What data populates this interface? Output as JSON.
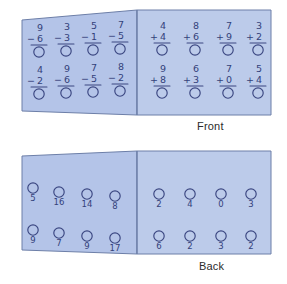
{
  "figure": {
    "title_front": "Front",
    "title_back": "Back",
    "colors": {
      "card_fill": "#b4c4e8",
      "card_fill_right": "#bccbea",
      "card_edge": "#6d7fa8",
      "ink": "#33417a",
      "caption_text": "#2b2b2b",
      "page_background": "#ffffff"
    }
  },
  "front_panel": {
    "label": "Front",
    "left_half": {
      "operation": "subtraction",
      "rows": [
        [
          {
            "top": "9",
            "bottom": "6",
            "sign": "−",
            "answer": ""
          },
          {
            "top": "3",
            "bottom": "3",
            "sign": "−",
            "answer": ""
          },
          {
            "top": "5",
            "bottom": "1",
            "sign": "−",
            "answer": ""
          },
          {
            "top": "7",
            "bottom": "5",
            "sign": "−",
            "answer": ""
          }
        ],
        [
          {
            "top": "4",
            "bottom": "2",
            "sign": "−",
            "answer": ""
          },
          {
            "top": "9",
            "bottom": "6",
            "sign": "−",
            "answer": ""
          },
          {
            "top": "7",
            "bottom": "5",
            "sign": "−",
            "answer": ""
          },
          {
            "top": "8",
            "bottom": "2",
            "sign": "−",
            "answer": ""
          }
        ]
      ]
    },
    "right_half": {
      "operation": "addition",
      "rows": [
        [
          {
            "top": "4",
            "bottom": "4",
            "sign": "+",
            "answer": ""
          },
          {
            "top": "8",
            "bottom": "6",
            "sign": "+",
            "answer": ""
          },
          {
            "top": "7",
            "bottom": "9",
            "sign": "+",
            "answer": ""
          },
          {
            "top": "3",
            "bottom": "2",
            "sign": "+",
            "answer": ""
          }
        ],
        [
          {
            "top": "9",
            "bottom": "8",
            "sign": "+",
            "answer": ""
          },
          {
            "top": "6",
            "bottom": "3",
            "sign": "+",
            "answer": ""
          },
          {
            "top": "7",
            "bottom": "0",
            "sign": "+",
            "answer": ""
          },
          {
            "top": "5",
            "bottom": "4",
            "sign": "+",
            "answer": ""
          }
        ]
      ]
    }
  },
  "back_panel": {
    "label": "Back",
    "left_half": {
      "rows": [
        [
          "5",
          "16",
          "14",
          "8"
        ],
        [
          "9",
          "7",
          "9",
          "17"
        ]
      ]
    },
    "right_half": {
      "rows": [
        [
          "2",
          "4",
          "0",
          "3"
        ],
        [
          "6",
          "2",
          "3",
          "2"
        ]
      ]
    }
  }
}
